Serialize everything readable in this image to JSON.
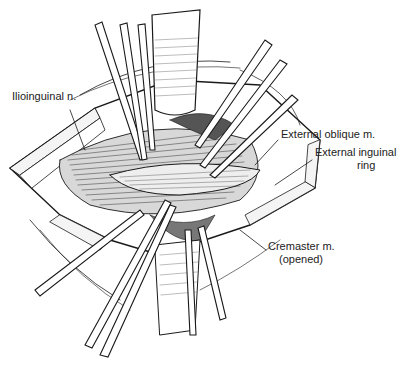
{
  "figure": {
    "type": "surgical-illustration",
    "colors": {
      "ink": "#1a1a1a",
      "background": "#ffffff",
      "muscle_shade": "#555555"
    }
  },
  "labels": [
    {
      "id": "ilioinguinal",
      "text": "Ilioinguinal n.",
      "x": 12,
      "y": 96
    },
    {
      "id": "external-oblique",
      "text": "External oblique m.",
      "x": 281,
      "y": 134
    },
    {
      "id": "external-inguinal-ring-1",
      "text": "External inguinal",
      "x": 315,
      "y": 152
    },
    {
      "id": "external-inguinal-ring-2",
      "text": "ring",
      "x": 357,
      "y": 165
    },
    {
      "id": "cremaster-1",
      "text": "Cremaster m.",
      "x": 268,
      "y": 246
    },
    {
      "id": "cremaster-2",
      "text": "(opened)",
      "x": 279,
      "y": 259
    }
  ]
}
